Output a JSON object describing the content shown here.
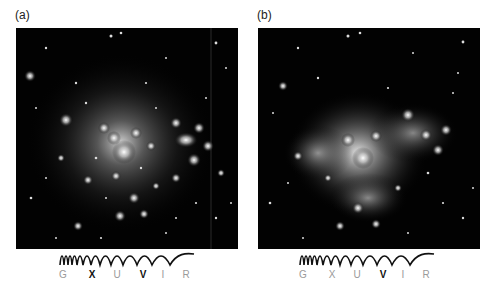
{
  "figure": {
    "panels": [
      {
        "id": "a",
        "label": "(a)",
        "description": "Galaxy cluster image, optical view with many compact galaxies and stars",
        "spectrum": {
          "icon": "wavelength-wave-icon",
          "bands": [
            {
              "label": "G",
              "highlighted": false
            },
            {
              "label": "X",
              "highlighted": true
            },
            {
              "label": "U",
              "highlighted": false
            },
            {
              "label": "V",
              "highlighted": true
            },
            {
              "label": "I",
              "highlighted": false
            },
            {
              "label": "R",
              "highlighted": false
            }
          ]
        }
      },
      {
        "id": "b",
        "label": "(b)",
        "description": "Galaxy cluster image with diffuse glowing hot gas around the core",
        "spectrum": {
          "icon": "wavelength-wave-icon",
          "bands": [
            {
              "label": "G",
              "highlighted": false
            },
            {
              "label": "X",
              "highlighted": false
            },
            {
              "label": "U",
              "highlighted": false
            },
            {
              "label": "V",
              "highlighted": true
            },
            {
              "label": "I",
              "highlighted": false
            },
            {
              "label": "R",
              "highlighted": false
            }
          ]
        }
      }
    ],
    "colors": {
      "background": "#ffffff",
      "image_bg": "#020202",
      "band_active": "#111111",
      "band_inactive": "#9a9a9a"
    }
  }
}
